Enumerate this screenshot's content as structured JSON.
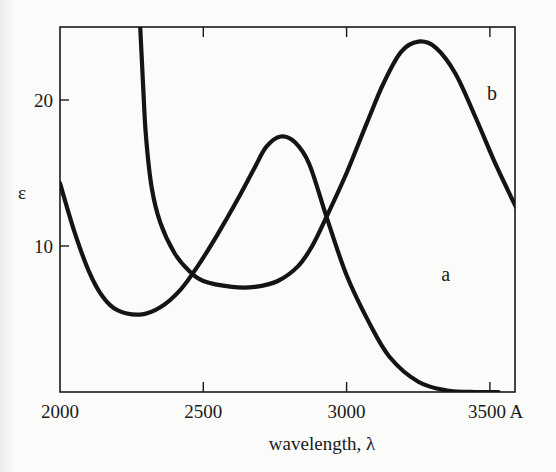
{
  "chart_data": {
    "type": "line",
    "title": "",
    "xlabel": "wavelength, λ",
    "ylabel": "ε",
    "xlim": [
      2000,
      3600
    ],
    "ylim": [
      0,
      25
    ],
    "grid": false,
    "legend": "inline curve labels",
    "x_ticks": [
      {
        "value": 2000,
        "label": "2000"
      },
      {
        "value": 2500,
        "label": "2500"
      },
      {
        "value": 3000,
        "label": "3000"
      },
      {
        "value": 3500,
        "label": "3500 A"
      }
    ],
    "y_ticks": [
      {
        "value": 10,
        "label": "10"
      },
      {
        "value": 20,
        "label": "20"
      }
    ],
    "series": [
      {
        "name": "a",
        "label_position": {
          "x": 3330,
          "y": 7.6
        },
        "points": [
          [
            2000,
            14.3
          ],
          [
            2050,
            11.0
          ],
          [
            2100,
            8.3
          ],
          [
            2150,
            6.5
          ],
          [
            2200,
            5.6
          ],
          [
            2280,
            5.3
          ],
          [
            2350,
            5.8
          ],
          [
            2420,
            7.0
          ],
          [
            2480,
            8.6
          ],
          [
            2550,
            10.8
          ],
          [
            2620,
            13.2
          ],
          [
            2680,
            15.4
          ],
          [
            2720,
            16.8
          ],
          [
            2770,
            17.5
          ],
          [
            2820,
            17.1
          ],
          [
            2870,
            15.6
          ],
          [
            2930,
            12.0
          ],
          [
            3000,
            8.0
          ],
          [
            3080,
            4.7
          ],
          [
            3150,
            2.4
          ],
          [
            3250,
            0.7
          ],
          [
            3350,
            0.1
          ],
          [
            3450,
            0.0
          ],
          [
            3530,
            0.0
          ]
        ]
      },
      {
        "name": "b",
        "label_position": {
          "x": 3490,
          "y": 20.0
        },
        "points": [
          [
            2280,
            25.0
          ],
          [
            2290,
            21.0
          ],
          [
            2300,
            17.5
          ],
          [
            2320,
            14.0
          ],
          [
            2350,
            11.6
          ],
          [
            2400,
            9.5
          ],
          [
            2450,
            8.3
          ],
          [
            2500,
            7.6
          ],
          [
            2600,
            7.2
          ],
          [
            2680,
            7.2
          ],
          [
            2760,
            7.6
          ],
          [
            2830,
            8.6
          ],
          [
            2880,
            10.0
          ],
          [
            2930,
            12.0
          ],
          [
            3000,
            15.0
          ],
          [
            3070,
            18.4
          ],
          [
            3130,
            21.2
          ],
          [
            3190,
            23.3
          ],
          [
            3250,
            24.0
          ],
          [
            3310,
            23.6
          ],
          [
            3380,
            21.8
          ],
          [
            3450,
            18.8
          ],
          [
            3520,
            15.6
          ],
          [
            3600,
            12.3
          ]
        ]
      }
    ]
  }
}
